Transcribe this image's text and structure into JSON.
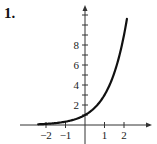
{
  "problem": {
    "number": "1."
  },
  "chart_data": {
    "type": "line",
    "title": "",
    "xlabel": "",
    "ylabel": "",
    "function": "y = 3^x",
    "xlim": [
      -3.2,
      3.3
    ],
    "ylim": [
      -2,
      11.5
    ],
    "x_ticks": [
      -2,
      -1,
      1,
      2
    ],
    "x_tick_labels": [
      "-2",
      "-1",
      "1",
      "2"
    ],
    "y_ticks": [
      1,
      2,
      3,
      4,
      5,
      6,
      7,
      8,
      9,
      10,
      11
    ],
    "y_tick_labels": [
      {
        "value": 2,
        "label": "2"
      },
      {
        "value": 4,
        "label": "4"
      },
      {
        "value": 6,
        "label": "6"
      },
      {
        "value": 8,
        "label": "8"
      }
    ],
    "grid": false,
    "series": [
      {
        "name": "curve",
        "color": "#111111",
        "x": [
          -2.4,
          -2,
          -1.5,
          -1,
          -0.5,
          0,
          0.5,
          1,
          1.5,
          2,
          2.15
        ],
        "y": [
          0.07,
          0.11,
          0.19,
          0.33,
          0.58,
          1,
          1.73,
          3,
          5.2,
          9,
          10.6
        ]
      }
    ]
  }
}
